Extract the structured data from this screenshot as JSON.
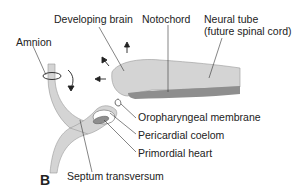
{
  "figure": {
    "panel_label": "B",
    "labels": {
      "developing_brain": "Developing brain",
      "notochord": "Notochord",
      "neural_tube_line1": "Neural tube",
      "neural_tube_line2": "(future spinal cord)",
      "amnion": "Amnion",
      "oropharyngeal_membrane": "Oropharyngeal membrane",
      "pericardial_coelom": "Pericardial coelom",
      "primordial_heart": "Primordial heart",
      "septum_transversum": "Septum transversum"
    },
    "colors": {
      "tissue_light": "#d4d4d4",
      "tissue_dark": "#8e8e8e",
      "outline": "#777777",
      "leader": "#333333"
    }
  }
}
